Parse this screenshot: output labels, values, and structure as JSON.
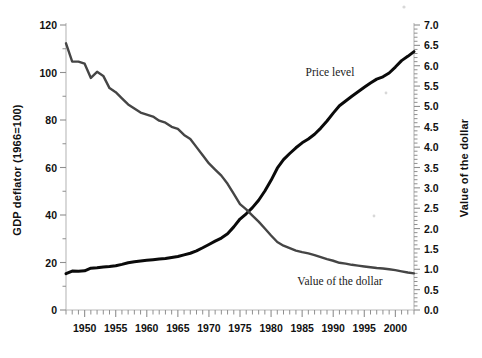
{
  "chart_data": {
    "type": "line",
    "title": "",
    "xlabel": "",
    "grid": false,
    "legend_position": "inline-annotations",
    "xlim": [
      1947,
      2003
    ],
    "x_ticks": [
      1950,
      1955,
      1960,
      1965,
      1970,
      1975,
      1980,
      1985,
      1990,
      1995,
      2000
    ],
    "x_tick_labels": [
      "1950",
      "1955",
      "1960",
      "1965",
      "1970",
      "1975",
      "1980",
      "1985",
      "1990",
      "1995",
      "2000"
    ],
    "x_minor_step": 1,
    "left_axis": {
      "label": "GDP deflator (1966=100)",
      "ylim": [
        0,
        120
      ],
      "ticks": [
        0,
        20,
        40,
        60,
        80,
        100,
        120
      ],
      "tick_labels": [
        "0",
        "20",
        "40",
        "60",
        "80",
        "100",
        "120"
      ],
      "minor_step": 10
    },
    "right_axis": {
      "label": "Value of the dollar",
      "ylim": [
        0.0,
        7.0
      ],
      "ticks": [
        0.0,
        0.5,
        1.0,
        1.5,
        2.0,
        2.5,
        3.0,
        3.5,
        4.0,
        4.5,
        5.0,
        5.5,
        6.0,
        6.5,
        7.0
      ],
      "tick_labels": [
        "0.0",
        "0.5",
        "1.0",
        "1.5",
        "2.0",
        "2.5",
        "3.0",
        "3.5",
        "4.0",
        "4.5",
        "5.0",
        "5.5",
        "6.0",
        "6.5",
        "7.0"
      ],
      "minor_step": 0.1
    },
    "series": [
      {
        "name": "Price level",
        "axis": "left",
        "color": "#0a0a0a",
        "width": 3.0,
        "annotation": "Price level",
        "x": [
          1947,
          1948,
          1949,
          1950,
          1951,
          1952,
          1953,
          1954,
          1955,
          1956,
          1957,
          1958,
          1959,
          1960,
          1961,
          1962,
          1963,
          1964,
          1965,
          1966,
          1967,
          1968,
          1969,
          1970,
          1971,
          1972,
          1973,
          1974,
          1975,
          1976,
          1977,
          1978,
          1979,
          1980,
          1981,
          1982,
          1983,
          1984,
          1985,
          1986,
          1987,
          1988,
          1989,
          1990,
          1991,
          1992,
          1993,
          1994,
          1995,
          1996,
          1997,
          1998,
          1999,
          2000,
          2001,
          2002,
          2003
        ],
        "y": [
          15.3,
          16.4,
          16.3,
          16.5,
          17.6,
          17.8,
          18.1,
          18.3,
          18.6,
          19.2,
          19.9,
          20.3,
          20.6,
          20.9,
          21.2,
          21.5,
          21.7,
          22.1,
          22.5,
          23.2,
          23.9,
          24.9,
          26.2,
          27.6,
          29.0,
          30.3,
          32.1,
          35.0,
          38.3,
          40.5,
          43.1,
          46.2,
          50.1,
          54.6,
          59.7,
          63.3,
          65.9,
          68.3,
          70.4,
          72.0,
          74.0,
          76.6,
          79.6,
          82.9,
          86.0,
          88.0,
          90.0,
          91.9,
          93.8,
          95.6,
          97.2,
          98.2,
          99.8,
          102.3,
          105.0,
          106.8,
          108.8
        ],
        "y_right_equivalent_note": "plotted on left axis (GDP deflator, 1966=100)"
      },
      {
        "name": "Value of the dollar",
        "axis": "right",
        "color": "#454545",
        "width": 2.4,
        "annotation": "Value of the dollar",
        "x": [
          1947,
          1948,
          1949,
          1950,
          1951,
          1952,
          1953,
          1954,
          1955,
          1956,
          1957,
          1958,
          1959,
          1960,
          1961,
          1962,
          1963,
          1964,
          1965,
          1966,
          1967,
          1968,
          1969,
          1970,
          1971,
          1972,
          1973,
          1974,
          1975,
          1976,
          1977,
          1978,
          1979,
          1980,
          1981,
          1982,
          1983,
          1984,
          1985,
          1986,
          1987,
          1988,
          1989,
          1990,
          1991,
          1992,
          1993,
          1994,
          1995,
          1996,
          1997,
          1998,
          1999,
          2000,
          2001,
          2002,
          2003
        ],
        "y": [
          6.55,
          6.1,
          6.1,
          6.05,
          5.7,
          5.85,
          5.75,
          5.45,
          5.35,
          5.2,
          5.05,
          4.95,
          4.85,
          4.8,
          4.75,
          4.65,
          4.6,
          4.5,
          4.45,
          4.3,
          4.2,
          4.0,
          3.8,
          3.6,
          3.45,
          3.3,
          3.1,
          2.85,
          2.6,
          2.47,
          2.32,
          2.17,
          2.0,
          1.83,
          1.67,
          1.58,
          1.52,
          1.46,
          1.42,
          1.39,
          1.35,
          1.3,
          1.25,
          1.21,
          1.16,
          1.14,
          1.11,
          1.09,
          1.07,
          1.05,
          1.03,
          1.02,
          1.0,
          0.98,
          0.95,
          0.92,
          0.9
        ]
      }
    ]
  },
  "axis_titles": {
    "left": "GDP deflator (1966=100)",
    "right": "Value of the dollar"
  },
  "annotations": {
    "price_level": "Price level",
    "value_of_dollar": "Value of the dollar"
  },
  "colors": {
    "price_level": "#0a0a0a",
    "value_of_dollar": "#454545",
    "axis": "#b9b9b9",
    "tick": "#8f8f8f",
    "text": "#111111",
    "background": "#ffffff"
  }
}
